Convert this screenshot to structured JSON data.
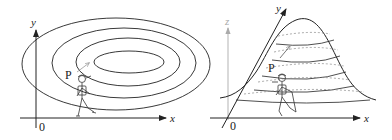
{
  "left_panel": {
    "title": "contour-map",
    "axis_x_label": "x",
    "axis_y_label": "y",
    "origin_label": "0",
    "point_label": "P",
    "contour_count": 4
  },
  "right_panel": {
    "title": "3d-hill-surface",
    "axis_x_label": "x",
    "axis_y_label": "y",
    "axis_z_label": "z",
    "origin_label": "0",
    "point_label": "P",
    "level_curve_count": 5
  },
  "colors": {
    "line": "#222222",
    "arrow_gray": "#999999",
    "dashed": "#888888",
    "z_axis": "#aaaaaa"
  }
}
